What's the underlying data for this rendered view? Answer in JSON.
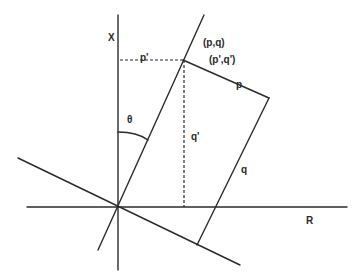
{
  "diagram": {
    "title": "",
    "colors": {
      "stroke": "#2b2b2b",
      "background": "#ffffff",
      "text": "#2a2a2a"
    },
    "labels": {
      "x_axis": "X",
      "r_axis": "R",
      "point_pq": "(p,q)",
      "point_pq_prime": "(p',q')",
      "p_prime": "p'",
      "q_prime": "q'",
      "p": "p",
      "q": "q",
      "theta": "θ"
    },
    "elements": [
      {
        "name": "x-axis",
        "type": "line",
        "from": [
          118,
          15
        ],
        "to": [
          118,
          270
        ]
      },
      {
        "name": "r-axis",
        "type": "line",
        "from": [
          27,
          207
        ],
        "to": [
          347,
          207
        ]
      },
      {
        "name": "rotated-q-axis",
        "type": "line",
        "from": [
          98,
          250
        ],
        "to": [
          204,
          15
        ]
      },
      {
        "name": "rotated-p-axis",
        "type": "line",
        "from": [
          18,
          158
        ],
        "to": [
          240,
          265
        ]
      },
      {
        "name": "p-segment",
        "type": "line",
        "from": [
          183,
          60
        ],
        "to": [
          269,
          98
        ]
      },
      {
        "name": "q-segment",
        "type": "line",
        "from": [
          269,
          98
        ],
        "to": [
          197,
          245
        ]
      },
      {
        "name": "p-prime-dashed",
        "type": "dashed",
        "from": [
          120,
          60
        ],
        "to": [
          183,
          60
        ]
      },
      {
        "name": "q-prime-dashed",
        "type": "dashed",
        "from": [
          184,
          60
        ],
        "to": [
          184,
          207
        ]
      },
      {
        "name": "theta-arc",
        "type": "arc",
        "center": [
          118,
          207
        ],
        "radius": 75
      }
    ]
  }
}
